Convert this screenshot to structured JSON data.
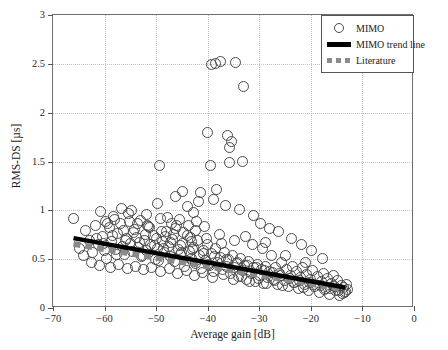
{
  "chart_data": {
    "type": "scatter",
    "title": "",
    "xlabel": "Average gain [dB]",
    "ylabel": "RMS-DS [µs]",
    "xlim": [
      -70,
      0
    ],
    "ylim": [
      0,
      3
    ],
    "xticks": [
      -70,
      -60,
      -50,
      -40,
      -30,
      -20,
      -10,
      0
    ],
    "xtick_labels": [
      "−70",
      "−60",
      "−50",
      "−40",
      "−30",
      "−20",
      "−10",
      "0"
    ],
    "yticks": [
      0,
      0.5,
      1,
      1.5,
      2,
      2.5,
      3
    ],
    "ytick_labels": [
      "0",
      "0.5",
      "1",
      "1.5",
      "2",
      "2.5",
      "3"
    ],
    "grid": true,
    "grid_style": "dotted",
    "grid_color": "#c4c4c4",
    "frame_color": "#6e6e6e",
    "marker": "open-circle",
    "marker_color": "#4a4a4a",
    "legend_position": "top-right",
    "series": [
      {
        "name": "MIMO",
        "type": "scatter",
        "points": [
          [
            -66.2,
            0.93
          ],
          [
            -65.0,
            0.62
          ],
          [
            -64.3,
            0.55
          ],
          [
            -63.8,
            0.8
          ],
          [
            -63.2,
            0.7
          ],
          [
            -62.5,
            0.58
          ],
          [
            -62.0,
            0.86
          ],
          [
            -61.4,
            0.66
          ],
          [
            -61.0,
            1.0
          ],
          [
            -60.6,
            0.74
          ],
          [
            -60.2,
            0.6
          ],
          [
            -59.8,
            0.52
          ],
          [
            -59.3,
            0.83
          ],
          [
            -58.9,
            0.69
          ],
          [
            -58.4,
            0.95
          ],
          [
            -58.0,
            0.61
          ],
          [
            -57.6,
            0.77
          ],
          [
            -57.2,
            0.88
          ],
          [
            -56.8,
            0.64
          ],
          [
            -56.4,
            0.56
          ],
          [
            -56.0,
            0.72
          ],
          [
            -55.6,
            0.98
          ],
          [
            -55.2,
            0.67
          ],
          [
            -54.8,
            0.59
          ],
          [
            -54.4,
            0.81
          ],
          [
            -54.0,
            0.73
          ],
          [
            -53.6,
            0.63
          ],
          [
            -53.2,
            0.91
          ],
          [
            -52.8,
            0.55
          ],
          [
            -52.4,
            0.7
          ],
          [
            -52.0,
            0.6
          ],
          [
            -51.6,
            0.84
          ],
          [
            -51.2,
            0.66
          ],
          [
            -50.8,
            0.75
          ],
          [
            -50.4,
            0.51
          ],
          [
            -50.0,
            0.62
          ],
          [
            -49.6,
            1.47
          ],
          [
            -49.4,
            0.93
          ],
          [
            -49.0,
            0.69
          ],
          [
            -48.6,
            0.58
          ],
          [
            -48.2,
            0.79
          ],
          [
            -47.8,
            0.64
          ],
          [
            -47.4,
            0.54
          ],
          [
            -47.0,
            0.71
          ],
          [
            -46.6,
            0.49
          ],
          [
            -46.2,
            0.86
          ],
          [
            -45.8,
            0.61
          ],
          [
            -45.4,
            0.56
          ],
          [
            -45.0,
            0.67
          ],
          [
            -44.6,
            0.44
          ],
          [
            -44.2,
            0.75
          ],
          [
            -43.8,
            0.59
          ],
          [
            -43.4,
            0.52
          ],
          [
            -43.0,
            0.63
          ],
          [
            -42.6,
            0.47
          ],
          [
            -42.2,
            0.7
          ],
          [
            -41.8,
            0.55
          ],
          [
            -41.4,
            0.41
          ],
          [
            -41.0,
            0.6
          ],
          [
            -40.6,
            0.5
          ],
          [
            -40.2,
            0.66
          ],
          [
            -39.8,
            0.45
          ],
          [
            -39.4,
            0.57
          ],
          [
            -39.0,
            0.38
          ],
          [
            -38.6,
            0.62
          ],
          [
            -38.2,
            0.48
          ],
          [
            -37.8,
            0.53
          ],
          [
            -37.4,
            0.4
          ],
          [
            -37.0,
            0.58
          ],
          [
            -36.6,
            0.44
          ],
          [
            -36.2,
            0.51
          ],
          [
            -35.8,
            0.36
          ],
          [
            -35.4,
            0.55
          ],
          [
            -35.0,
            0.42
          ],
          [
            -34.6,
            0.47
          ],
          [
            -34.2,
            0.33
          ],
          [
            -33.8,
            0.52
          ],
          [
            -33.4,
            0.39
          ],
          [
            -33.0,
            0.45
          ],
          [
            -32.6,
            0.3
          ],
          [
            -32.2,
            0.49
          ],
          [
            -31.8,
            0.36
          ],
          [
            -31.4,
            0.42
          ],
          [
            -31.0,
            0.28
          ],
          [
            -30.6,
            0.46
          ],
          [
            -30.2,
            0.34
          ],
          [
            -29.8,
            0.4
          ],
          [
            -29.4,
            0.26
          ],
          [
            -29.0,
            0.44
          ],
          [
            -28.6,
            0.32
          ],
          [
            -28.2,
            0.38
          ],
          [
            -27.8,
            0.55
          ],
          [
            -27.4,
            0.3
          ],
          [
            -27.0,
            0.42
          ],
          [
            -26.6,
            0.25
          ],
          [
            -26.2,
            0.36
          ],
          [
            -25.8,
            0.48
          ],
          [
            -25.4,
            0.29
          ],
          [
            -25.0,
            0.4
          ],
          [
            -24.6,
            0.23
          ],
          [
            -24.2,
            0.34
          ],
          [
            -23.8,
            0.44
          ],
          [
            -23.4,
            0.27
          ],
          [
            -23.0,
            0.38
          ],
          [
            -22.6,
            0.21
          ],
          [
            -22.2,
            0.32
          ],
          [
            -21.8,
            0.42
          ],
          [
            -21.4,
            0.25
          ],
          [
            -21.0,
            0.35
          ],
          [
            -20.6,
            0.19
          ],
          [
            -20.2,
            0.3
          ],
          [
            -19.8,
            0.39
          ],
          [
            -19.4,
            0.23
          ],
          [
            -19.0,
            0.33
          ],
          [
            -18.6,
            0.17
          ],
          [
            -18.2,
            0.28
          ],
          [
            -17.8,
            0.36
          ],
          [
            -17.4,
            0.21
          ],
          [
            -17.0,
            0.31
          ],
          [
            -16.6,
            0.15
          ],
          [
            -16.2,
            0.26
          ],
          [
            -15.8,
            0.34
          ],
          [
            -15.4,
            0.19
          ],
          [
            -15.0,
            0.29
          ],
          [
            -14.6,
            0.14
          ],
          [
            -14.2,
            0.24
          ],
          [
            -13.8,
            0.22
          ],
          [
            -13.4,
            0.18
          ],
          [
            -13.0,
            0.2
          ],
          [
            -39.5,
            2.5
          ],
          [
            -38.6,
            2.51
          ],
          [
            -37.8,
            2.53
          ],
          [
            -34.8,
            2.52
          ],
          [
            -33.2,
            2.28
          ],
          [
            -40.2,
            1.81
          ],
          [
            -36.4,
            1.78
          ],
          [
            -35.6,
            1.72
          ],
          [
            -35.9,
            1.65
          ],
          [
            -39.6,
            1.47
          ],
          [
            -36.0,
            1.5
          ],
          [
            -33.4,
            1.51
          ],
          [
            -45.0,
            1.2
          ],
          [
            -41.6,
            1.19
          ],
          [
            -38.4,
            1.22
          ],
          [
            -42.0,
            1.1
          ],
          [
            -39.0,
            1.12
          ],
          [
            -36.8,
            1.06
          ],
          [
            -34.0,
            1.02
          ],
          [
            -31.4,
            0.96
          ],
          [
            -46.5,
            1.15
          ],
          [
            -44.2,
            1.05
          ],
          [
            -43.0,
            0.99
          ],
          [
            -30.0,
            0.88
          ],
          [
            -28.2,
            0.82
          ],
          [
            -26.4,
            0.79
          ],
          [
            -24.0,
            0.72
          ],
          [
            -22.0,
            0.66
          ],
          [
            -20.0,
            0.6
          ],
          [
            -18.0,
            0.52
          ],
          [
            -57.0,
            1.03
          ],
          [
            -55.0,
            1.01
          ],
          [
            -52.0,
            0.97
          ],
          [
            -50.0,
            1.08
          ],
          [
            -48.0,
            0.94
          ],
          [
            -47.2,
            0.88
          ],
          [
            -45.6,
            0.92
          ],
          [
            -44.0,
            0.86
          ],
          [
            -42.4,
            0.9
          ],
          [
            -40.8,
            0.84
          ],
          [
            -53.8,
            0.88
          ],
          [
            -51.4,
            0.83
          ],
          [
            -49.2,
            0.79
          ],
          [
            -46.8,
            0.76
          ],
          [
            -43.6,
            0.73
          ],
          [
            -62.8,
            0.48
          ],
          [
            -61.2,
            0.45
          ],
          [
            -59.0,
            0.43
          ],
          [
            -57.4,
            0.46
          ],
          [
            -55.8,
            0.41
          ],
          [
            -54.2,
            0.44
          ],
          [
            -52.6,
            0.4
          ],
          [
            -51.0,
            0.43
          ],
          [
            -49.4,
            0.38
          ],
          [
            -47.6,
            0.41
          ],
          [
            -46.0,
            0.36
          ],
          [
            -44.4,
            0.39
          ],
          [
            -42.8,
            0.34
          ],
          [
            -41.2,
            0.37
          ],
          [
            -39.2,
            0.32
          ],
          [
            -37.2,
            0.35
          ],
          [
            -35.2,
            0.3
          ],
          [
            -33.6,
            0.33
          ],
          [
            -32.0,
            0.28
          ],
          [
            -30.4,
            0.31
          ],
          [
            -28.8,
            0.26
          ],
          [
            -27.2,
            0.29
          ],
          [
            -25.6,
            0.24
          ],
          [
            -23.6,
            0.27
          ],
          [
            -21.6,
            0.22
          ],
          [
            -19.6,
            0.25
          ],
          [
            -17.6,
            0.2
          ],
          [
            -15.6,
            0.23
          ],
          [
            -14.0,
            0.16
          ],
          [
            -13.2,
            0.25
          ],
          [
            -58.6,
            0.75
          ],
          [
            -56.2,
            0.7
          ],
          [
            -53.4,
            0.68
          ],
          [
            -50.6,
            0.65
          ],
          [
            -48.8,
            0.62
          ],
          [
            -45.2,
            0.58
          ],
          [
            -43.2,
            0.61
          ],
          [
            -41.0,
            0.57
          ],
          [
            -38.8,
            0.54
          ],
          [
            -36.6,
            0.51
          ],
          [
            -34.4,
            0.48
          ],
          [
            -32.4,
            0.45
          ],
          [
            -30.8,
            0.42
          ],
          [
            -29.2,
            0.39
          ],
          [
            -27.6,
            0.37
          ],
          [
            -60.0,
            0.9
          ],
          [
            -58.2,
            0.92
          ],
          [
            -56.6,
            0.8
          ],
          [
            -54.6,
            0.78
          ],
          [
            -52.2,
            0.76
          ],
          [
            -26.0,
            0.34
          ],
          [
            -24.4,
            0.31
          ],
          [
            -22.4,
            0.29
          ],
          [
            -20.4,
            0.27
          ],
          [
            -18.4,
            0.24
          ],
          [
            -16.4,
            0.21
          ],
          [
            -14.8,
            0.19
          ],
          [
            -13.6,
            0.17
          ],
          [
            -31.6,
            0.66
          ],
          [
            -29.6,
            0.62
          ],
          [
            -47.4,
            0.68
          ],
          [
            -45.4,
            0.65
          ],
          [
            -43.4,
            0.69
          ],
          [
            -40.4,
            0.72
          ],
          [
            -37.6,
            0.67
          ],
          [
            -50.2,
            0.72
          ],
          [
            -48.4,
            0.74
          ],
          [
            -44.8,
            0.78
          ],
          [
            -42.6,
            0.8
          ],
          [
            -38.0,
            0.76
          ],
          [
            -35.0,
            0.7
          ],
          [
            -32.8,
            0.74
          ],
          [
            -29.0,
            0.68
          ],
          [
            -25.2,
            0.55
          ],
          [
            -21.2,
            0.48
          ],
          [
            -61.8,
            0.72
          ],
          [
            -60.4,
            0.67
          ],
          [
            -59.6,
            0.88
          ],
          [
            -57.8,
            0.56
          ],
          [
            -55.4,
            0.9
          ],
          [
            -53.0,
            0.54
          ],
          [
            -51.8,
            0.86
          ],
          [
            -49.8,
            0.5
          ],
          [
            -46.4,
            0.82
          ],
          [
            -40.0,
            0.46
          ]
        ]
      },
      {
        "name": "MIMO trend line",
        "type": "line",
        "style": "solid",
        "color": "#000000",
        "width": 4,
        "x": [
          -66.0,
          -13.0
        ],
        "y": [
          0.7,
          0.19
        ]
      },
      {
        "name": "Literature",
        "type": "line",
        "style": "dashed",
        "color": "#8a8a8a",
        "width": 5,
        "x": [
          -66.0,
          -13.0
        ],
        "y": [
          0.64,
          0.17
        ]
      }
    ],
    "legend": [
      {
        "label": "MIMO",
        "key": "open-circle"
      },
      {
        "label": "MIMO trend line",
        "key": "solid-line"
      },
      {
        "label": "Literature",
        "key": "dashed-line"
      }
    ]
  }
}
